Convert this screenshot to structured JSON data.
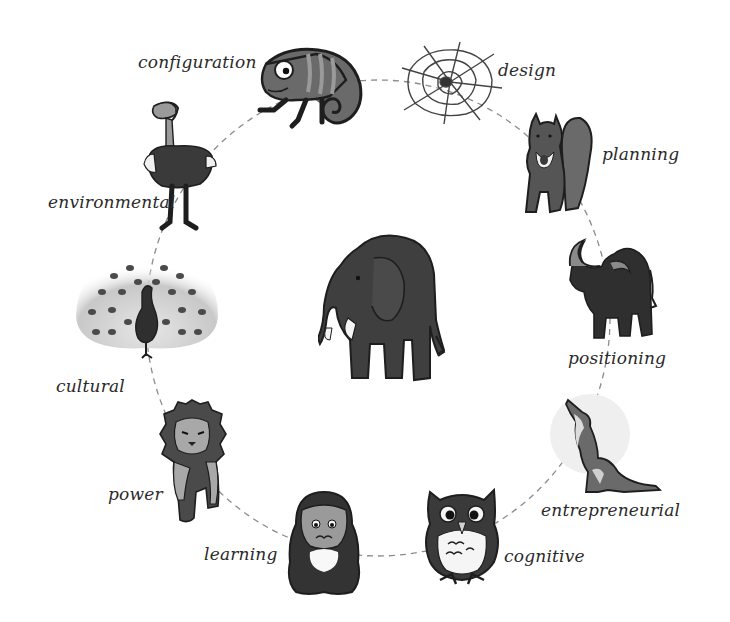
{
  "diagram": {
    "center": {
      "name": "elephant",
      "icon": "elephant-icon"
    },
    "nodes": [
      {
        "animal": "chameleon",
        "label": "configuration",
        "icon": "chameleon-icon"
      },
      {
        "animal": "spider-web",
        "label": "design",
        "icon": "spider-web-icon"
      },
      {
        "animal": "squirrel",
        "label": "planning",
        "icon": "squirrel-icon"
      },
      {
        "animal": "buffalo",
        "label": "positioning",
        "icon": "buffalo-icon"
      },
      {
        "animal": "wolf",
        "label": "entrepreneurial",
        "icon": "wolf-icon"
      },
      {
        "animal": "owl",
        "label": "cognitive",
        "icon": "owl-icon"
      },
      {
        "animal": "ape",
        "label": "learning",
        "icon": "ape-icon"
      },
      {
        "animal": "lion",
        "label": "power",
        "icon": "lion-icon"
      },
      {
        "animal": "peacock",
        "label": "cultural",
        "icon": "peacock-icon"
      },
      {
        "animal": "ostrich",
        "label": "environmental",
        "icon": "ostrich-icon"
      }
    ],
    "connector": "dashed-circle",
    "colors": {
      "ink": "#1e1e1e",
      "dark_fill": "#3a3a3a",
      "mid_fill": "#5e5e5e",
      "light_fill": "#9a9a9a",
      "dash": "#8c8c8c",
      "text": "#2a2a2a"
    }
  }
}
